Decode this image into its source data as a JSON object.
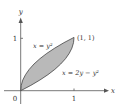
{
  "figure": {
    "type": "region-between-curves",
    "axes": {
      "x_label": "x",
      "y_label": "y",
      "origin_label": "0",
      "x_tick_label": "1",
      "y_tick_label": "1"
    },
    "curves": [
      {
        "name": "upper-left-curve",
        "label": "x = y²",
        "equation": "x = y^2"
      },
      {
        "name": "lower-right-curve",
        "label": "x = 2y − y²",
        "equation": "x = 2y - y^2"
      }
    ],
    "point": {
      "label": "(1, 1)",
      "x": 1,
      "y": 1
    },
    "colors": {
      "fill": "#b9b9b9",
      "stroke": "#444444",
      "axis": "#555555",
      "text": "#333333"
    }
  }
}
